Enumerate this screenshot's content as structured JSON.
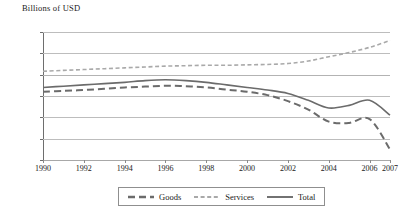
{
  "chart_data": {
    "type": "line",
    "title": "Billions of USD",
    "xlabel": "",
    "ylabel": "Billions of USD",
    "grid": true,
    "legend_position": "bottom",
    "ylim": [
      -200,
      100
    ],
    "yticks": [
      100,
      50,
      0,
      -50,
      -100,
      -150,
      -200
    ],
    "ytick_labels": [
      "100",
      "50",
      "0",
      "–50",
      "–100",
      "–150",
      "–200"
    ],
    "categories": [
      1990,
      1991,
      1992,
      1993,
      1994,
      1995,
      1996,
      1997,
      1998,
      1999,
      2000,
      2001,
      2002,
      2003,
      2004,
      2005,
      2006,
      2007
    ],
    "xtick_labels": [
      "1990",
      "1992",
      "1994",
      "1996",
      "1998",
      "2000",
      "2002",
      "2004",
      "2006",
      "2007"
    ],
    "xtick_values": [
      1990,
      1992,
      1994,
      1996,
      1998,
      2000,
      2002,
      2004,
      2006,
      2007
    ],
    "series": [
      {
        "name": "Goods",
        "style": "dashed",
        "color": "#6b6b6b",
        "values": [
          -40,
          -38,
          -36,
          -33,
          -30,
          -28,
          -26,
          -27,
          -30,
          -35,
          -40,
          -48,
          -62,
          -82,
          -110,
          -113,
          -104,
          -175
        ]
      },
      {
        "name": "Services",
        "style": "fine-dashed",
        "color": "#a9a9a9",
        "values": [
          8,
          10,
          12,
          14,
          16,
          18,
          20,
          21,
          22,
          22,
          23,
          24,
          26,
          32,
          42,
          52,
          64,
          80
        ]
      },
      {
        "name": "Total",
        "style": "solid",
        "color": "#6b6b6b",
        "values": [
          -30,
          -27,
          -24,
          -21,
          -18,
          -14,
          -12,
          -14,
          -18,
          -24,
          -30,
          -36,
          -44,
          -60,
          -78,
          -72,
          -60,
          -95
        ]
      }
    ]
  },
  "legend": {
    "items": [
      {
        "label": "Goods",
        "style": "dashed"
      },
      {
        "label": "Services",
        "style": "fine-dashed"
      },
      {
        "label": "Total",
        "style": "solid"
      }
    ]
  }
}
